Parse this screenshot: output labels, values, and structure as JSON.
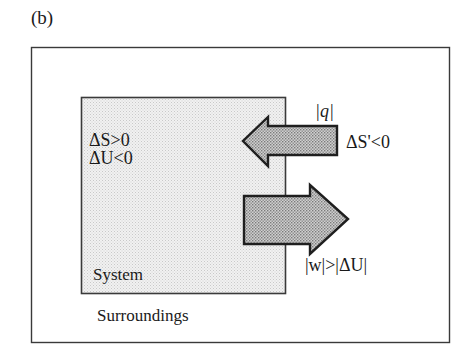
{
  "figure": {
    "panel_label": "(b)",
    "surroundings": {
      "label": "Surroundings",
      "entropy_change": "ΔS'<0"
    },
    "system": {
      "label": "System",
      "entropy_change": "ΔS>0",
      "energy_change": "ΔU<0"
    },
    "arrows": [
      {
        "name": "heat-arrow",
        "direction": "into-system",
        "label": "|q|"
      },
      {
        "name": "work-arrow",
        "direction": "out-of-system",
        "label": "|w|>|ΔU|"
      }
    ],
    "colors": {
      "border": "#333333",
      "system_fill": "#e9e9e9",
      "arrow_fill": "#b8b8b8"
    }
  }
}
